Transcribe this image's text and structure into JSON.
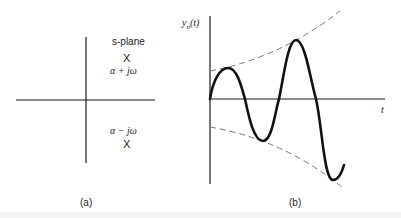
{
  "figure": {
    "panel_a": {
      "title": "s-plane",
      "pole_upper_marker": "X",
      "pole_upper_label": "α + jω",
      "pole_lower_label": "α − jω",
      "pole_lower_marker": "X",
      "caption": "(a)"
    },
    "panel_b": {
      "y_label_main": "y",
      "y_label_sub": "n",
      "y_label_arg": "(t)",
      "x_label": "t",
      "caption": "(b)",
      "description": "Growing oscillation with exponentially diverging dashed envelopes"
    },
    "colors": {
      "ink": "#1a1a1a",
      "dashed": "#777777",
      "background": "#ffffff"
    }
  }
}
